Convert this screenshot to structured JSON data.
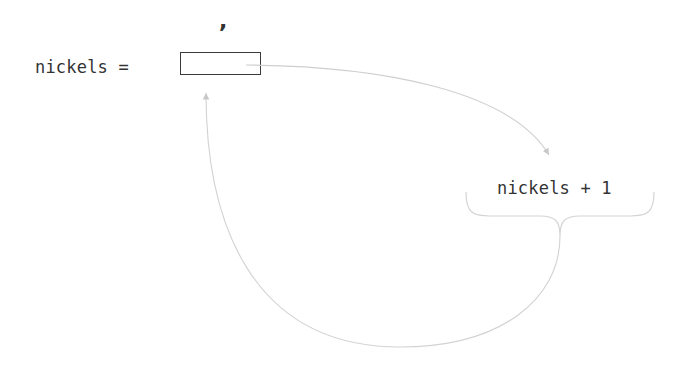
{
  "diagram": {
    "assignment": {
      "variable_label": "nickels =",
      "box_value": "",
      "mark_above_box": ","
    },
    "expression": {
      "label": "nickels + 1"
    },
    "arrows": [
      {
        "from": "assignment-box",
        "to": "expression",
        "description": "value read from box into expression"
      },
      {
        "from": "expression-brace",
        "to": "assignment-box",
        "description": "result stored back into box"
      }
    ],
    "colors": {
      "text": "#333333",
      "box_border": "#3a3a3a",
      "arrow": "#cccccc"
    }
  }
}
